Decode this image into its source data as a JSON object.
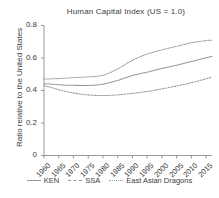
{
  "chart_data": {
    "type": "line",
    "title": "Human Capital Index (US = 1.0)",
    "xlabel": "",
    "ylabel": "Ratio relative to the United States",
    "xlim": [
      1960,
      2017
    ],
    "ylim": [
      0,
      0.8
    ],
    "grid": false,
    "legend_position": "bottom",
    "x_ticks": [
      "1960",
      "1965",
      "1970",
      "1975",
      "1980",
      "1985",
      "1990",
      "1995",
      "2000",
      "2005",
      "2010",
      "2015"
    ],
    "y_ticks": [
      "0",
      "0.2",
      "0.4",
      "0.6",
      "0.8"
    ],
    "x": [
      1960,
      1965,
      1970,
      1975,
      1980,
      1985,
      1990,
      1995,
      2000,
      2005,
      2010,
      2015,
      2017
    ],
    "series": [
      {
        "name": "KEN",
        "style": "solid",
        "color": "#9a9a9a",
        "values": [
          0.442,
          0.436,
          0.432,
          0.431,
          0.438,
          0.462,
          0.492,
          0.513,
          0.535,
          0.556,
          0.578,
          0.601,
          0.611
        ]
      },
      {
        "name": "SSA",
        "style": "dashed",
        "color": "#9a9a9a",
        "values": [
          0.432,
          0.405,
          0.385,
          0.373,
          0.369,
          0.373,
          0.382,
          0.394,
          0.41,
          0.428,
          0.448,
          0.472,
          0.483
        ]
      },
      {
        "name": "East Asian Dragons",
        "style": "dotted",
        "color": "#9a9a9a",
        "values": [
          0.47,
          0.474,
          0.479,
          0.484,
          0.494,
          0.533,
          0.586,
          0.624,
          0.65,
          0.672,
          0.694,
          0.707,
          0.71
        ]
      }
    ]
  },
  "axis": {
    "line_color": "#8c8c8c",
    "text_color": "#3b3b3b"
  }
}
